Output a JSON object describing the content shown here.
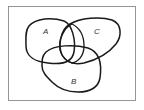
{
  "diagram": {
    "type": "venn",
    "sets": [
      {
        "id": "A",
        "label": "A"
      },
      {
        "id": "B",
        "label": "B"
      },
      {
        "id": "C",
        "label": "C"
      }
    ],
    "colors": {
      "outline": "#1a1a1a",
      "frame": "#8a8a8a",
      "background": "#ffffff",
      "label": "#333333"
    }
  }
}
